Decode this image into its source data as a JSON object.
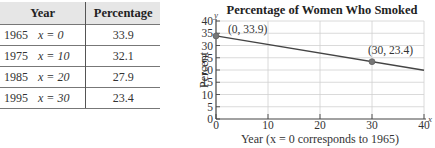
{
  "table": {
    "headers": [
      "Year",
      "Percentage"
    ],
    "rows": [
      {
        "year": "1965",
        "x": "x = 0",
        "value": "33.9"
      },
      {
        "year": "1975",
        "x": "x = 10",
        "value": "32.1"
      },
      {
        "year": "1985",
        "x": "x = 20",
        "value": "27.9"
      },
      {
        "year": "1995",
        "x": "x = 30",
        "value": "23.4"
      }
    ]
  },
  "chart_data": {
    "type": "line",
    "title": "Percentage of Women Who Smoked",
    "xlabel": "Year (x = 0 corresponds to 1965)",
    "ylabel": "Percent",
    "x_axis_var": "x",
    "y_axis_var": "y",
    "xlim": [
      0,
      40
    ],
    "ylim": [
      0,
      40
    ],
    "x_ticks": [
      0,
      10,
      20,
      30,
      40
    ],
    "y_ticks": [
      0,
      5,
      10,
      15,
      20,
      25,
      30,
      35,
      40
    ],
    "grid": true,
    "series": [
      {
        "name": "trend line",
        "x": [
          0,
          40
        ],
        "y": [
          33.9,
          19.9
        ]
      }
    ],
    "points": [
      {
        "x": 0,
        "y": 33.9,
        "label": "(0, 33.9)"
      },
      {
        "x": 30,
        "y": 23.4,
        "label": "(30, 23.4)"
      }
    ],
    "colors": {
      "line": "#444444",
      "point": "#777777",
      "grid": "#d0d0d0"
    }
  }
}
